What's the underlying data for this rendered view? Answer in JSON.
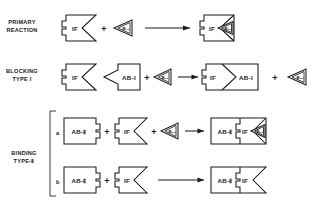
{
  "figure": {
    "background_color": "#ffffff",
    "line_color": "#1a1a1a"
  },
  "symbols": {
    "if_label": "IF",
    "b12_label": "B₁₂",
    "ab1_label": "AB-I",
    "ab2_label": "AB-Ⅱ",
    "plus": "+"
  },
  "rows": [
    {
      "id": "primary-reaction",
      "label_line1": "PRIMARY",
      "label_line2": "REACTION",
      "sublabel": "",
      "reactants": [
        "IF",
        "B₁₂"
      ],
      "products": [
        "IF·B₁₂"
      ],
      "byproducts": []
    },
    {
      "id": "blocking-type-i",
      "label_line1": "BLOCKING",
      "label_line2": "TYPE I",
      "sublabel": "",
      "reactants": [
        "IF",
        "AB-I",
        "B₁₂"
      ],
      "products": [
        "IF·AB-I"
      ],
      "byproducts": [
        "B₁₂"
      ]
    },
    {
      "id": "binding-type-ii-a",
      "label_line1": "BINDING",
      "label_line2": "TYPE-Ⅱ",
      "sublabel": "a",
      "reactants": [
        "AB-Ⅱ",
        "IF",
        "B₁₂"
      ],
      "products": [
        "AB-Ⅱ·IF·B₁₂"
      ],
      "byproducts": []
    },
    {
      "id": "binding-type-ii-b",
      "label_line1": "",
      "label_line2": "",
      "sublabel": "b",
      "reactants": [
        "AB-Ⅱ",
        "IF"
      ],
      "products": [
        "AB-Ⅱ·IF"
      ],
      "byproducts": []
    }
  ],
  "group_label": {
    "line1": "BINDING",
    "line2": "TYPE-Ⅱ"
  }
}
